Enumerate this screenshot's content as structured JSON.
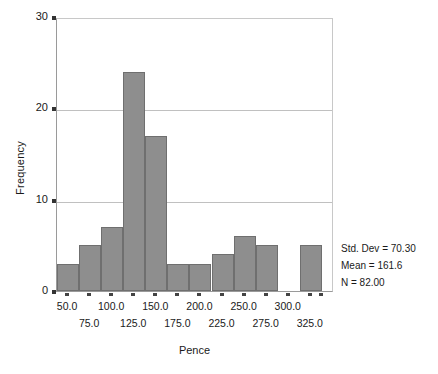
{
  "chart_data": {
    "type": "bar",
    "title": "",
    "subtitle": "",
    "xlabel": "Pence",
    "ylabel": "Frequency",
    "grid": true,
    "legend": "none",
    "ylim": [
      0,
      30
    ],
    "ytick_labels": [
      "0",
      "10",
      "20",
      "30"
    ],
    "ytick_values": [
      0,
      10,
      20,
      30
    ],
    "xlim": [
      37.5,
      350.0
    ],
    "bin_width": 25,
    "xtick_labels": [
      "50.0",
      "75.0",
      "100.0",
      "125.0",
      "150.0",
      "175.0",
      "200.0",
      "225.0",
      "250.0",
      "275.0",
      "300.0",
      "325.0"
    ],
    "xtick_values": [
      50.0,
      75.0,
      100.0,
      125.0,
      150.0,
      175.0,
      200.0,
      225.0,
      250.0,
      275.0,
      300.0,
      325.0
    ],
    "bin_centers": [
      50.0,
      75.0,
      100.0,
      125.0,
      150.0,
      175.0,
      200.0,
      225.0,
      250.0,
      275.0,
      300.0,
      325.0
    ],
    "categories": [
      "50.0",
      "75.0",
      "100.0",
      "125.0",
      "150.0",
      "175.0",
      "200.0",
      "225.0",
      "250.0",
      "275.0",
      "300.0",
      "325.0"
    ],
    "values": [
      3,
      5,
      7,
      24,
      17,
      3,
      3,
      4,
      6,
      5,
      0,
      5
    ],
    "bar_color": "#8e8e8e",
    "bar_edge_color": "#6f6f6f",
    "grid_color": "#c0c0c0",
    "annotations": [
      "Std. Dev = 70.30",
      "Mean = 161.6",
      "N = 82.00"
    ]
  },
  "stats": {
    "std_dev": "Std. Dev = 70.30",
    "mean": "Mean = 161.6",
    "n": "N = 82.00"
  }
}
